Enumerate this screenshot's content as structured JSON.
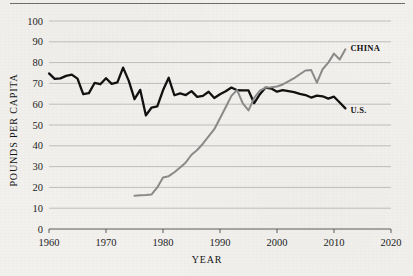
{
  "chart_data": {
    "type": "line",
    "title": "",
    "xlabel": "YEAR",
    "ylabel": "POUNDS PER CAPITA",
    "xlim": [
      1960,
      2020
    ],
    "ylim": [
      0,
      100
    ],
    "xticks": [
      1960,
      1970,
      1980,
      1990,
      2000,
      2010,
      2020
    ],
    "yticks": [
      0,
      10,
      20,
      30,
      40,
      50,
      60,
      70,
      80,
      90,
      100
    ],
    "grid": "horizontal",
    "legend_position": "inline-right-of-series",
    "series": [
      {
        "name": "U.S.",
        "color": "#111111",
        "label_text": "U.S.",
        "x": [
          1960,
          1961,
          1962,
          1963,
          1964,
          1965,
          1966,
          1967,
          1968,
          1969,
          1970,
          1971,
          1972,
          1973,
          1974,
          1975,
          1976,
          1977,
          1978,
          1979,
          1980,
          1981,
          1982,
          1983,
          1984,
          1985,
          1986,
          1987,
          1988,
          1989,
          1990,
          1991,
          1992,
          1993,
          1994,
          1995,
          1996,
          1997,
          1998,
          1999,
          2000,
          2001,
          2002,
          2003,
          2004,
          2005,
          2006,
          2007,
          2008,
          2009,
          2010,
          2011,
          2012
        ],
        "values": [
          74.8,
          72.2,
          72.4,
          73.6,
          74.2,
          72.3,
          64.8,
          65.3,
          70.2,
          69.6,
          72.5,
          69.8,
          70.5,
          77.6,
          71.2,
          62.4,
          66.9,
          54.6,
          58.4,
          58.9,
          66.7,
          72.7,
          64.3,
          65.2,
          64.4,
          66.3,
          63.5,
          64.0,
          66.0,
          63.0,
          64.8,
          66.2,
          68.0,
          66.7,
          66.6,
          66.6,
          60.5,
          64.8,
          68.0,
          67.5,
          66.0,
          66.8,
          66.3,
          65.8,
          65.0,
          64.4,
          63.2,
          64.1,
          63.8,
          62.7,
          63.6,
          60.8,
          58.0
        ]
      },
      {
        "name": "CHINA",
        "color": "#8a8a8a",
        "label_text": "CHINA",
        "x": [
          1975,
          1976,
          1977,
          1978,
          1979,
          1980,
          1981,
          1982,
          1983,
          1984,
          1985,
          1986,
          1987,
          1988,
          1989,
          1990,
          1991,
          1992,
          1993,
          1994,
          1995,
          1996,
          1997,
          1998,
          1999,
          2000,
          2001,
          2002,
          2003,
          2004,
          2005,
          2006,
          2007,
          2008,
          2009,
          2010,
          2011,
          2012
        ],
        "values": [
          16.0,
          16.2,
          16.3,
          16.6,
          20.0,
          24.8,
          25.4,
          27.3,
          29.6,
          32.0,
          35.7,
          38.0,
          41.0,
          44.5,
          48.0,
          53.2,
          58.5,
          64.0,
          66.8,
          60.4,
          57.0,
          63.0,
          66.5,
          68.0,
          68.2,
          68.5,
          69.5,
          71.0,
          72.5,
          74.4,
          76.2,
          76.4,
          70.4,
          76.8,
          80.0,
          84.3,
          81.5,
          86.4
        ]
      }
    ]
  }
}
